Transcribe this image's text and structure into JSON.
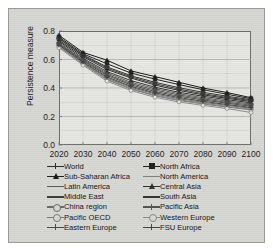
{
  "chart_data": {
    "type": "line",
    "title": "",
    "xlabel": "",
    "ylabel": "Persistence measure",
    "xlim": [
      2020,
      2100
    ],
    "ylim": [
      0.0,
      0.8
    ],
    "yticks": [
      "0.8",
      "0.6",
      "0.4",
      "0.2",
      "0.0"
    ],
    "ytick_values": [
      0.8,
      0.6,
      0.4,
      0.2,
      0.0
    ],
    "xticks": [
      "2020",
      "2030",
      "2040",
      "2050",
      "2060",
      "2070",
      "2080",
      "2090",
      "2100"
    ],
    "x": [
      2020,
      2030,
      2040,
      2050,
      2060,
      2070,
      2080,
      2090,
      2100
    ],
    "grid": "horizontal",
    "legend_position": "below-axes-two-columns",
    "series": [
      {
        "name": "World",
        "marker": "cross-filled",
        "color": "#2a2a2a",
        "values": [
          0.735,
          0.62,
          0.53,
          0.47,
          0.42,
          0.383,
          0.352,
          0.327,
          0.305
        ]
      },
      {
        "name": "Sub-Saharan Africa",
        "marker": "triangle-filled",
        "color": "#1a1a1a",
        "values": [
          0.77,
          0.65,
          0.595,
          0.52,
          0.48,
          0.44,
          0.4,
          0.368,
          0.332
        ]
      },
      {
        "name": "Latin America",
        "marker": "dash",
        "color": "#5c5c5c",
        "values": [
          0.718,
          0.6,
          0.505,
          0.44,
          0.395,
          0.36,
          0.332,
          0.308,
          0.288
        ]
      },
      {
        "name": "Middle East",
        "marker": "line",
        "color": "#3d3d3d",
        "values": [
          0.745,
          0.628,
          0.54,
          0.478,
          0.43,
          0.392,
          0.36,
          0.334,
          0.312
        ]
      },
      {
        "name": "China region",
        "marker": "circle-open",
        "color": "#6a6a6a",
        "values": [
          0.7,
          0.578,
          0.47,
          0.405,
          0.358,
          0.325,
          0.3,
          0.278,
          0.258
        ]
      },
      {
        "name": "Pacific OECD",
        "marker": "circle-open",
        "color": "#7a7a7a",
        "values": [
          0.69,
          0.568,
          0.458,
          0.392,
          0.345,
          0.312,
          0.288,
          0.266,
          0.246
        ]
      },
      {
        "name": "Eastern Europe",
        "marker": "cross",
        "color": "#4a4a4a",
        "values": [
          0.708,
          0.59,
          0.488,
          0.422,
          0.375,
          0.342,
          0.316,
          0.293,
          0.272
        ]
      },
      {
        "name": "North Africa",
        "marker": "square-filled",
        "color": "#222222",
        "values": [
          0.758,
          0.64,
          0.57,
          0.505,
          0.462,
          0.424,
          0.388,
          0.356,
          0.325
        ]
      },
      {
        "name": "North America",
        "marker": "dash",
        "color": "#808080",
        "values": [
          0.695,
          0.572,
          0.462,
          0.398,
          0.35,
          0.318,
          0.293,
          0.271,
          0.251
        ]
      },
      {
        "name": "Central Asia",
        "marker": "triangle-filled",
        "color": "#2f2f2f",
        "values": [
          0.728,
          0.608,
          0.515,
          0.452,
          0.405,
          0.37,
          0.342,
          0.318,
          0.296
        ]
      },
      {
        "name": "South Asia",
        "marker": "dash-filled",
        "color": "#353535",
        "values": [
          0.75,
          0.632,
          0.548,
          0.486,
          0.44,
          0.402,
          0.37,
          0.342,
          0.318
        ]
      },
      {
        "name": "Pacific Asia",
        "marker": "cross",
        "color": "#545454",
        "values": [
          0.712,
          0.594,
          0.496,
          0.43,
          0.385,
          0.351,
          0.324,
          0.3,
          0.28
        ]
      },
      {
        "name": "Western Europe",
        "marker": "circle-open",
        "color": "#8a8a8a",
        "values": [
          0.682,
          0.56,
          0.448,
          0.382,
          0.335,
          0.302,
          0.278,
          0.256,
          0.228
        ]
      },
      {
        "name": "FSU Europe",
        "marker": "cross-filled",
        "color": "#444444",
        "values": [
          0.702,
          0.582,
          0.478,
          0.412,
          0.366,
          0.333,
          0.307,
          0.284,
          0.264
        ]
      }
    ],
    "legend_columns": [
      [
        "World",
        "Sub-Saharan Africa",
        "Latin America",
        "Middle East",
        "China region",
        "Pacific OECD",
        "Eastern Europe"
      ],
      [
        "North Africa",
        "North America",
        "Central Asia",
        "South Asia",
        "Pacific Asia",
        "Western Europe",
        "FSU Europe"
      ]
    ]
  },
  "colors": {
    "figure_background": "#d7d7d4",
    "axes_background": "#e6e6e3",
    "axis_line": "#6e6e6b",
    "gridline": "#a6a6a3",
    "text": "#1d1d1d"
  }
}
